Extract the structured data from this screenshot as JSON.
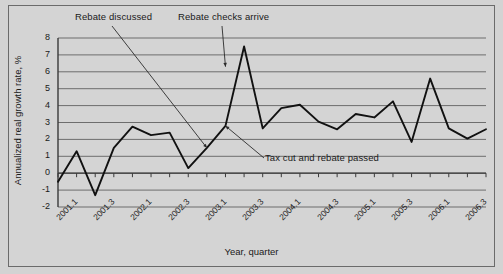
{
  "chart_data": {
    "type": "line",
    "title": "",
    "xlabel": "Year, quarter",
    "ylabel": "Annualized real growth rate, %",
    "ylim": [
      -2,
      8
    ],
    "ytick_step": 1,
    "grid": true,
    "legend": "none",
    "line_color": "#111111",
    "plot_background": "#d4d4d4",
    "gridline_color": "#6d6d6d",
    "x": [
      "2001.1",
      "2001.2",
      "2001.3",
      "2001.4",
      "2002.1",
      "2002.2",
      "2002.3",
      "2002.4",
      "2003.1",
      "2003.2",
      "2003.3",
      "2003.4",
      "2004.1",
      "2004.2",
      "2004.3",
      "2004.4",
      "2005.1",
      "2005.2",
      "2005.3",
      "2005.4",
      "2006.1",
      "2006.2",
      "2006.3",
      "2006.4"
    ],
    "values": [
      -0.5,
      1.3,
      -1.3,
      1.5,
      2.75,
      2.25,
      2.4,
      0.3,
      1.5,
      2.8,
      7.5,
      2.65,
      3.85,
      4.05,
      3.05,
      2.6,
      3.5,
      3.3,
      4.25,
      1.85,
      5.6,
      2.65,
      2.05,
      2.6
    ],
    "xtick_labels": [
      "2001.1",
      "2001.3",
      "2002.1",
      "2002.3",
      "2003.1",
      "2003.3",
      "2004.1",
      "2004.3",
      "2005.1",
      "2005.3",
      "2006.1",
      "2006.3"
    ],
    "xtick_indices": [
      0,
      2,
      4,
      6,
      8,
      10,
      12,
      14,
      16,
      18,
      20,
      22
    ],
    "ytick_labels": [
      "8",
      "7",
      "6",
      "5",
      "4",
      "3",
      "2",
      "1",
      "0",
      "-1",
      "-2"
    ],
    "ytick_values": [
      8,
      7,
      6,
      5,
      4,
      3,
      2,
      1,
      0,
      -1,
      -2
    ],
    "annotations": [
      {
        "name": "rebate-discussed",
        "text": "Rebate discussed",
        "target_x": "2003.1",
        "target_y": 1.5
      },
      {
        "name": "rebate-checks-arrive",
        "text": "Rebate checks arrive",
        "target_x": "2003.2",
        "target_y": 6.3
      },
      {
        "name": "tax-cut-and-rebate-passed",
        "text": "Tax cut and rebate passed",
        "target_x": "2003.2",
        "target_y": 2.8
      }
    ]
  }
}
